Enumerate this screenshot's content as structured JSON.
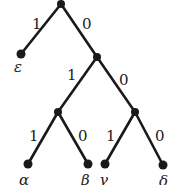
{
  "diagram": {
    "type": "binary-tree",
    "nodes": {
      "root": {
        "x": 61,
        "y": 4
      },
      "n1": {
        "x": 97,
        "y": 57
      },
      "n2": {
        "x": 58,
        "y": 112
      },
      "n3": {
        "x": 135,
        "y": 112
      },
      "epsilon": {
        "x": 21,
        "y": 54,
        "label": "ε"
      },
      "alpha": {
        "x": 28,
        "y": 164,
        "label": "α"
      },
      "beta": {
        "x": 88,
        "y": 164,
        "label": "β"
      },
      "gamma": {
        "x": 105,
        "y": 164,
        "label": "γ"
      },
      "delta": {
        "x": 163,
        "y": 165,
        "label": "δ"
      }
    },
    "edges": [
      {
        "from": "root",
        "to": "epsilon",
        "label": "1"
      },
      {
        "from": "root",
        "to": "n1",
        "label": "0"
      },
      {
        "from": "n1",
        "to": "n2",
        "label": "1"
      },
      {
        "from": "n1",
        "to": "n3",
        "label": "0"
      },
      {
        "from": "n2",
        "to": "alpha",
        "label": "1"
      },
      {
        "from": "n2",
        "to": "beta",
        "label": "0"
      },
      {
        "from": "n3",
        "to": "gamma",
        "label": "1"
      },
      {
        "from": "n3",
        "to": "delta",
        "label": "0"
      }
    ]
  }
}
